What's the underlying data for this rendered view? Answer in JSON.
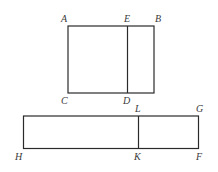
{
  "diagram": {
    "top_rectangle": {
      "corners": {
        "A": [
          68,
          26
        ],
        "B": [
          154,
          26
        ],
        "C": [
          68,
          93
        ],
        "D": [
          127.5,
          93
        ],
        "E": [
          127.5,
          26
        ]
      },
      "labels": {
        "A": {
          "text": "A",
          "x": 61,
          "y": 22
        },
        "E": {
          "text": "E",
          "x": 124,
          "y": 22
        },
        "B": {
          "text": "B",
          "x": 155,
          "y": 22
        },
        "C": {
          "text": "C",
          "x": 61,
          "y": 104
        },
        "D": {
          "text": "D",
          "x": 123,
          "y": 104
        }
      }
    },
    "bottom_rectangle": {
      "corners": {
        "H": [
          23.5,
          116
        ],
        "G": [
          198.5,
          116
        ],
        "F": [
          198.5,
          148.5
        ],
        "K": [
          138.5,
          148.5
        ],
        "L": [
          138.5,
          116
        ]
      },
      "labels": {
        "L": {
          "text": "L",
          "x": 135,
          "y": 112
        },
        "G": {
          "text": "G",
          "x": 196,
          "y": 112
        },
        "H": {
          "text": "H",
          "x": 15,
          "y": 160
        },
        "K": {
          "text": "K",
          "x": 134,
          "y": 160
        },
        "F": {
          "text": "F",
          "x": 196,
          "y": 160
        }
      }
    }
  }
}
